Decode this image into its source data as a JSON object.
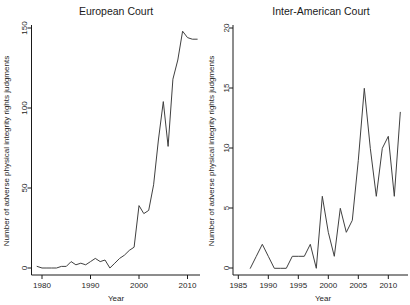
{
  "figure_title_left": "European Court",
  "figure_title_right": "Inter-American Court",
  "colors": {
    "line": "#404040",
    "axis": "#1a1a1a",
    "text": "#262626",
    "background": "#ffffff"
  },
  "chart_data": [
    {
      "type": "line",
      "title": "European Court",
      "xlabel": "Year",
      "ylabel": "Number of adverse physical integrity rights judgments",
      "x": [
        1979,
        1980,
        1981,
        1982,
        1983,
        1984,
        1985,
        1986,
        1987,
        1988,
        1989,
        1990,
        1991,
        1992,
        1993,
        1994,
        1995,
        1996,
        1997,
        1998,
        1999,
        2000,
        2001,
        2002,
        2003,
        2004,
        2005,
        2006,
        2007,
        2008,
        2009,
        2010,
        2011,
        2012
      ],
      "values": [
        1,
        0,
        0,
        0,
        0,
        1,
        1,
        4,
        2,
        3,
        2,
        4,
        6,
        4,
        5,
        0,
        3,
        6,
        8,
        11,
        13,
        39,
        34,
        36,
        52,
        80,
        104,
        76,
        118,
        130,
        148,
        144,
        143,
        143
      ],
      "xticks": [
        1980,
        1990,
        2000,
        2010
      ],
      "yticks": [
        0,
        50,
        100,
        150
      ],
      "xlim": [
        1977,
        2013
      ],
      "ylim": [
        0,
        150
      ],
      "grid": false,
      "legend": null
    },
    {
      "type": "line",
      "title": "Inter-American Court",
      "xlabel": "Year",
      "ylabel": "Number of adverse physical integrity rights judgments",
      "x": [
        1987,
        1988,
        1989,
        1990,
        1991,
        1992,
        1993,
        1994,
        1995,
        1996,
        1997,
        1998,
        1999,
        2000,
        2001,
        2002,
        2003,
        2004,
        2005,
        2006,
        2007,
        2008,
        2009,
        2010,
        2011,
        2012
      ],
      "values": [
        0,
        1,
        2,
        1,
        0,
        0,
        0,
        1,
        1,
        1,
        2,
        0,
        6,
        3,
        1,
        5,
        3,
        4,
        9,
        15,
        10,
        6,
        10,
        11,
        6,
        13
      ],
      "xticks": [
        1985,
        1990,
        1995,
        2000,
        2005,
        2010
      ],
      "yticks": [
        0,
        5,
        10,
        15,
        20
      ],
      "xlim": [
        1984,
        2013
      ],
      "ylim": [
        0,
        20
      ],
      "grid": false,
      "legend": null
    }
  ]
}
